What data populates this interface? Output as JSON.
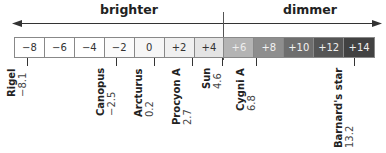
{
  "header": {
    "brighter_label": "brighter",
    "dimmer_label": "dimmer"
  },
  "scale": {
    "cells": [
      {
        "label": "−8",
        "bg": "#ffffff",
        "fg": "#333333"
      },
      {
        "label": "−6",
        "bg": "#ffffff",
        "fg": "#333333"
      },
      {
        "label": "−4",
        "bg": "#ffffff",
        "fg": "#333333"
      },
      {
        "label": "−2",
        "bg": "#fbfbfb",
        "fg": "#333333"
      },
      {
        "label": "0",
        "bg": "#f6f6f6",
        "fg": "#333333"
      },
      {
        "label": "+2",
        "bg": "#f0f0f0",
        "fg": "#333333"
      },
      {
        "label": "+4",
        "bg": "#e4e4e4",
        "fg": "#333333"
      },
      {
        "label": "+6",
        "bg": "#b4b4b4",
        "fg": "#eeeeee"
      },
      {
        "label": "+8",
        "bg": "#8e8e8e",
        "fg": "#f2f2f2"
      },
      {
        "label": "+10",
        "bg": "#6e6e6e",
        "fg": "#f2f2f2"
      },
      {
        "label": "+12",
        "bg": "#555555",
        "fg": "#eeeeee"
      },
      {
        "label": "+14",
        "bg": "#424242",
        "fg": "#eeeeee"
      }
    ]
  },
  "stars": [
    {
      "name": "Rigel",
      "magnitude": "−8.1",
      "x": 27
    },
    {
      "name": "Canopus",
      "magnitude": "−2.5",
      "x": 116
    },
    {
      "name": "Arcturus",
      "magnitude": "0.2",
      "x": 154
    },
    {
      "name": "Procyon A",
      "magnitude": "2.7",
      "x": 192
    },
    {
      "name": "Sun",
      "magnitude": "4.6",
      "x": 222
    },
    {
      "name": "Cygni A",
      "magnitude": "6.8",
      "x": 256
    },
    {
      "name": "Barnard's star",
      "magnitude": "13.2",
      "x": 354
    }
  ]
}
